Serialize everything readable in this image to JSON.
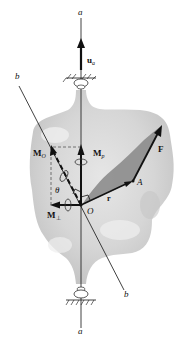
{
  "figure": {
    "labels": {
      "axis_top": "a",
      "axis_bottom": "a",
      "line_b_top": "b",
      "line_b_bottom": "b",
      "unit_vector": "u",
      "unit_vector_sub": "a",
      "moment_O": "M",
      "moment_O_sub": "O",
      "moment_parallel": "M",
      "moment_parallel_sub": "p",
      "moment_perp": "M",
      "moment_perp_sub": "⊥",
      "angle": "θ",
      "origin": "O",
      "point_A": "A",
      "position_vector": "r",
      "force": "F"
    },
    "colors": {
      "body_fill": "#d9d9d9",
      "body_shadow": "#b8b8b8",
      "plane_fill": "#8c8c8c",
      "line": "#111111",
      "dashed": "#555555"
    }
  }
}
